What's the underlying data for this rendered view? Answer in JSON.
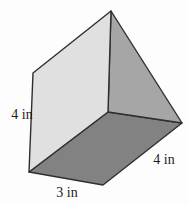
{
  "figure": {
    "shape": "triangular-prism",
    "unit": "in",
    "dimensions": {
      "height": 4,
      "base": 3,
      "length": 4
    },
    "labels": {
      "left_height": "4 in",
      "bottom_base": "3 in",
      "right_length": "4 in"
    },
    "colors": {
      "front_face": "#e0e0e0",
      "right_face": "#a6a6a6",
      "bottom_face": "#828282",
      "edge": "#2f2f2f",
      "text": "#1c1c1c",
      "background": "#fdfdfd"
    }
  }
}
